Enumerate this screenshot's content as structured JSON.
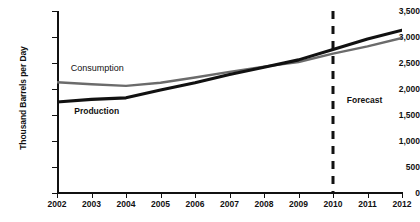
{
  "chart_data": {
    "type": "line",
    "title": "",
    "xlabel": "",
    "ylabel": "Thousand Barrels per Day",
    "categories": [
      2002,
      2003,
      2004,
      2005,
      2006,
      2007,
      2008,
      2009,
      2010,
      2011,
      2012
    ],
    "xlim": [
      2002,
      2012
    ],
    "ylim": [
      0,
      3500
    ],
    "ytick_labels": [
      "3,500",
      "3,000",
      "2,500",
      "2,000",
      "1,500",
      "1,000",
      "500",
      "0"
    ],
    "ytick_values": [
      3500,
      3000,
      2500,
      2000,
      1500,
      1000,
      500,
      0
    ],
    "xtick_labels": [
      "2002",
      "2003",
      "2004",
      "2005",
      "2006",
      "2007",
      "2008",
      "2009",
      "2010",
      "2011",
      "2012"
    ],
    "grid": false,
    "legend_position": "inline-annotation",
    "series": [
      {
        "name": "Production",
        "color": "#111111",
        "style": "solid-bold",
        "values": [
          1750,
          1800,
          1830,
          1980,
          2120,
          2280,
          2420,
          2560,
          2760,
          2960,
          3130
        ]
      },
      {
        "name": "Consumption",
        "color": "#6b6b6b",
        "style": "solid",
        "values": [
          2130,
          2090,
          2060,
          2120,
          2220,
          2330,
          2430,
          2520,
          2680,
          2820,
          2980
        ]
      }
    ],
    "annotations": [
      {
        "name": "consumption-label",
        "text": "Consumption",
        "x": 2002.4,
        "y": 2380
      },
      {
        "name": "production-label",
        "text": "Production",
        "x": 2002.5,
        "y": 1560
      },
      {
        "name": "forecast-label",
        "text": "Forecast",
        "x": 2010.4,
        "y": 1760
      }
    ],
    "divider": {
      "name": "forecast-divider",
      "label": "Forecast",
      "x": 2010,
      "style": "dashed",
      "color": "#111111"
    }
  }
}
